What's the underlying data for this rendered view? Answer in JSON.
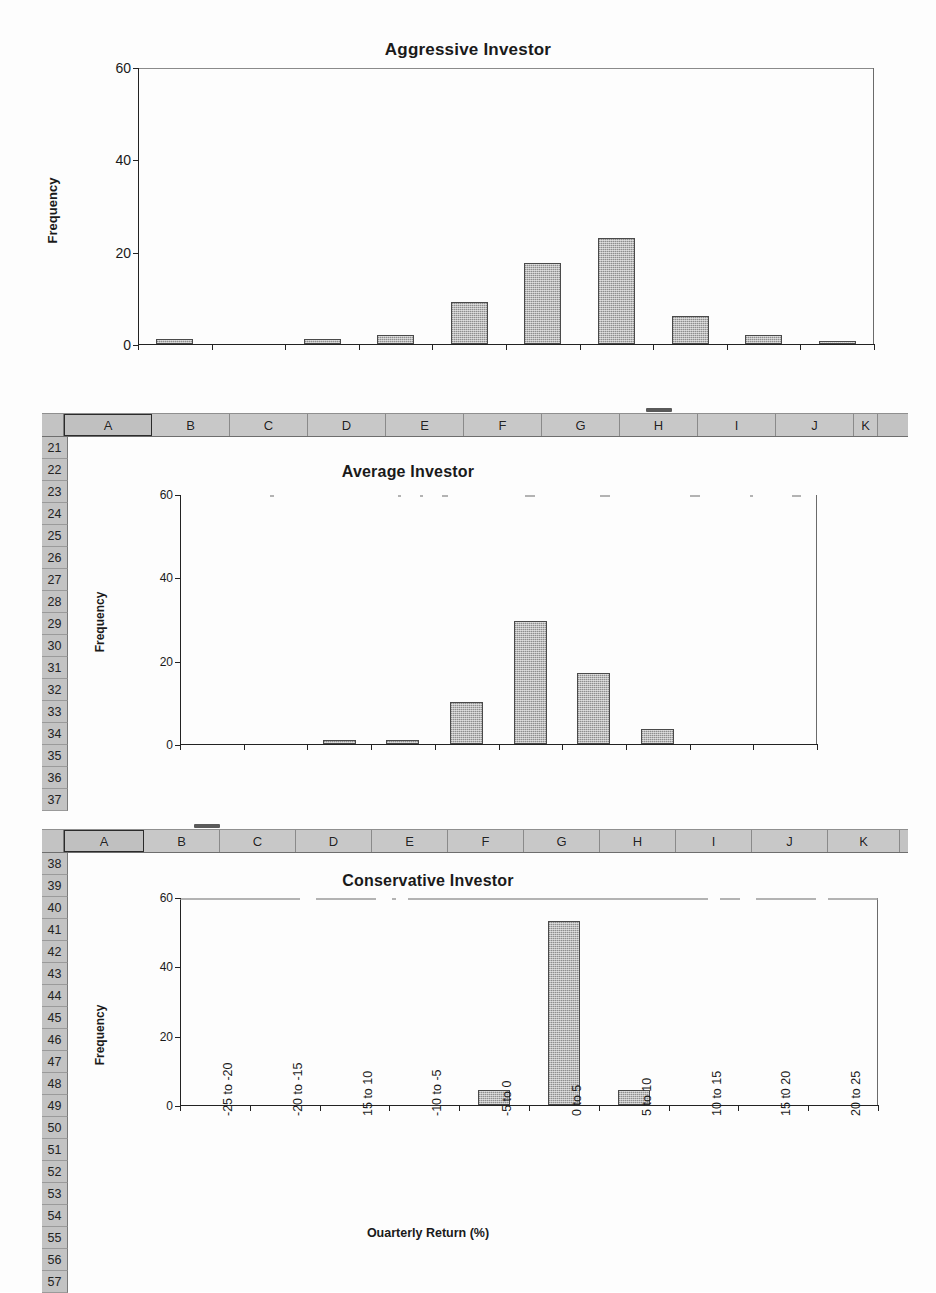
{
  "document": {
    "kind": "scanned-spreadsheet-page",
    "axis_title": "Ouarterly Return (%)",
    "y_axis_title": "Frequency"
  },
  "categories": [
    "-25 to -20",
    "-20 to -15",
    "15 to 10",
    "-10 to -5",
    "-5 to 0",
    "0 to 5",
    "5 to 10",
    "10 to 15",
    "15 t0 20",
    "20 to 25"
  ],
  "y_ticks": [
    "0",
    "20",
    "40",
    "60"
  ],
  "charts": [
    {
      "title": "Aggressive Investor"
    },
    {
      "title": "Average Investor"
    },
    {
      "title": "Conservative Investor"
    }
  ],
  "sheet1": {
    "columns": [
      "A",
      "B",
      "C",
      "D",
      "E",
      "F",
      "G",
      "H",
      "I",
      "J",
      "K"
    ],
    "selected_column": "A",
    "rows": [
      "21",
      "22",
      "23",
      "24",
      "25",
      "26",
      "27",
      "28",
      "29",
      "30",
      "31",
      "32",
      "33",
      "34",
      "35",
      "36",
      "37"
    ]
  },
  "sheet2": {
    "columns": [
      "A",
      "B",
      "C",
      "D",
      "E",
      "F",
      "G",
      "H",
      "I",
      "J",
      "K"
    ],
    "selected_column": "A",
    "rows": [
      "38",
      "39",
      "40",
      "41",
      "42",
      "43",
      "44",
      "45",
      "46",
      "47",
      "48",
      "49",
      "50",
      "51",
      "52",
      "53",
      "54",
      "55",
      "56",
      "57"
    ]
  },
  "chart_data": [
    {
      "type": "bar",
      "title": "Aggressive Investor",
      "xlabel": "",
      "ylabel": "Frequency",
      "ylim": [
        0,
        60
      ],
      "yticks": [
        0,
        20,
        40,
        60
      ],
      "grid": false,
      "legend": "none",
      "categories": [
        "-25 to -20",
        "-20 to -15",
        "15 to 10",
        "-10 to -5",
        "-5 to 0",
        "0 to 5",
        "5 to 10",
        "10 to 15",
        "15 t0 20",
        "20 to 25"
      ],
      "values": [
        1,
        0,
        1,
        2,
        9,
        17.5,
        23,
        6,
        2,
        0.7
      ]
    },
    {
      "type": "bar",
      "title": "Average Investor",
      "xlabel": "",
      "ylabel": "Frequency",
      "ylim": [
        0,
        60
      ],
      "yticks": [
        0,
        20,
        40,
        60
      ],
      "grid": false,
      "legend": "none",
      "categories": [
        "-25 to -20",
        "-20 to -15",
        "15 to 10",
        "-10 to -5",
        "-5 to 0",
        "0 to 5",
        "5 to 10",
        "10 to 15",
        "15 t0 20",
        "20 to 25"
      ],
      "values": [
        0,
        0,
        1,
        1,
        10,
        29.5,
        17,
        3.5,
        0,
        0
      ]
    },
    {
      "type": "bar",
      "title": "Conservative Investor",
      "xlabel": "Ouarterly Return (%)",
      "ylabel": "Frequency",
      "ylim": [
        0,
        60
      ],
      "yticks": [
        0,
        20,
        40,
        60
      ],
      "grid": false,
      "legend": "none",
      "categories": [
        "-25 to -20",
        "-20 to -15",
        "15 to 10",
        "-10 to -5",
        "-5 to 0",
        "0 to 5",
        "5 to 10",
        "10 to 15",
        "15 t0 20",
        "20 to 25"
      ],
      "values": [
        0,
        0,
        0,
        0,
        4.2,
        53,
        4.2,
        0,
        0,
        0
      ]
    }
  ]
}
